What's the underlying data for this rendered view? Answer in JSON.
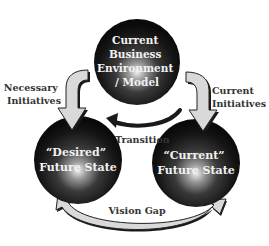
{
  "diagram": {
    "nodes": {
      "top": {
        "lines": [
          "Current",
          "Business",
          "Environment",
          "/ Model"
        ]
      },
      "left": {
        "lines": [
          "“Desired”",
          "Future State"
        ]
      },
      "right": {
        "lines": [
          "“Current”",
          "Future State"
        ]
      }
    },
    "edges": {
      "necessary_initiatives": {
        "lines": [
          "Necessary",
          "Initiatives"
        ]
      },
      "current_initiatives": {
        "lines": [
          "Current",
          "Initiatives"
        ]
      },
      "transition": {
        "label": "Transition"
      },
      "vision_gap": {
        "label": "Vision Gap"
      }
    },
    "colors": {
      "sphere_dark": "#111111",
      "sphere_light": "#ffffff",
      "arrow_fill": "#d9d9d9",
      "arrow_shadow": "#1a1a1a",
      "text_dark": "#333333",
      "text_light": "#f2f2f2"
    }
  }
}
